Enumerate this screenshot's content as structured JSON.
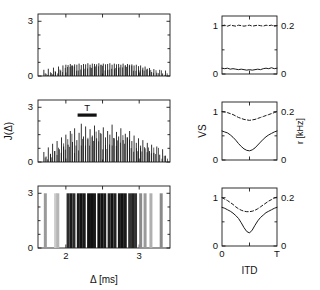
{
  "figure": {
    "title": "",
    "panels_left_ylabel": "J(Δ)",
    "panels_left_xlabel": "Δ [ms]",
    "panels_right_ylabel": "VS",
    "panels_right_ylabel2": "r [kHz]",
    "panels_right_xlabel": "ITD",
    "marker_label": "T"
  },
  "chart_data": [
    {
      "type": "bar",
      "name": "interval-histogram-top",
      "panel": "A",
      "title": "",
      "xlabel": "Δ [ms]",
      "ylabel": "J(Δ)",
      "xlim": [
        1.62,
        3.42
      ],
      "ylim": [
        0,
        3.4
      ],
      "xticks": [
        2,
        3
      ],
      "xticklabels": [
        "2",
        "3"
      ],
      "yticks": [
        0,
        3
      ],
      "yticklabels": [
        "0",
        "3"
      ],
      "grid": false,
      "description": "Flat, unmodulated interval distribution: dense short spikes of near-uniform low amplitude across the central range.",
      "x": [
        1.7,
        1.73,
        1.76,
        1.8,
        1.83,
        1.86,
        1.9,
        1.93,
        1.96,
        2.0,
        2.03,
        2.06,
        2.09,
        2.12,
        2.15,
        2.18,
        2.21,
        2.24,
        2.27,
        2.3,
        2.33,
        2.36,
        2.39,
        2.42,
        2.45,
        2.48,
        2.51,
        2.54,
        2.57,
        2.6,
        2.63,
        2.66,
        2.69,
        2.72,
        2.75,
        2.78,
        2.81,
        2.84,
        2.87,
        2.9,
        2.93,
        2.96,
        2.99,
        3.02,
        3.05,
        3.08,
        3.11,
        3.14,
        3.17,
        3.2,
        3.24,
        3.28,
        3.32,
        3.36
      ],
      "values": [
        0.34,
        0.12,
        0.4,
        0.16,
        0.46,
        0.22,
        0.52,
        0.3,
        0.58,
        0.62,
        0.6,
        0.66,
        0.58,
        0.64,
        0.62,
        0.68,
        0.6,
        0.66,
        0.64,
        0.7,
        0.62,
        0.68,
        0.66,
        0.64,
        0.7,
        0.62,
        0.68,
        0.64,
        0.66,
        0.7,
        0.62,
        0.68,
        0.64,
        0.66,
        0.62,
        0.68,
        0.6,
        0.66,
        0.62,
        0.64,
        0.58,
        0.62,
        0.54,
        0.58,
        0.46,
        0.52,
        0.4,
        0.44,
        0.22,
        0.38,
        0.18,
        0.34,
        0.14,
        0.3
      ]
    },
    {
      "type": "bar",
      "name": "interval-histogram-middle",
      "panel": "B",
      "title": "",
      "xlabel": "Δ [ms]",
      "ylabel": "J(Δ)",
      "xlim": [
        1.62,
        3.42
      ],
      "ylim": [
        0,
        3.4
      ],
      "xticks": [
        2,
        3
      ],
      "xticklabels": [
        "2",
        "3"
      ],
      "yticks": [
        0,
        3
      ],
      "yticklabels": [
        "0",
        "3"
      ],
      "grid": false,
      "marker_label": "T",
      "marker_bar_range": [
        2.16,
        2.42
      ],
      "description": "Partially modulated interval distribution: noisy spikes with irregular amplitudes up to about 2, clustered periodically.",
      "x": [
        1.7,
        1.73,
        1.76,
        1.79,
        1.82,
        1.85,
        1.88,
        1.91,
        1.94,
        1.97,
        2.0,
        2.03,
        2.06,
        2.09,
        2.12,
        2.15,
        2.18,
        2.21,
        2.24,
        2.27,
        2.3,
        2.33,
        2.36,
        2.39,
        2.42,
        2.45,
        2.48,
        2.51,
        2.54,
        2.57,
        2.6,
        2.63,
        2.66,
        2.69,
        2.72,
        2.75,
        2.78,
        2.81,
        2.84,
        2.87,
        2.9,
        2.93,
        2.96,
        2.99,
        3.02,
        3.05,
        3.08,
        3.11,
        3.14,
        3.17,
        3.2,
        3.24,
        3.28,
        3.32,
        3.36
      ],
      "values": [
        0.55,
        0.3,
        0.8,
        0.45,
        1.0,
        0.6,
        1.15,
        0.7,
        1.35,
        0.85,
        1.5,
        0.95,
        1.7,
        1.1,
        1.85,
        1.2,
        1.6,
        2.1,
        1.4,
        1.95,
        1.25,
        1.8,
        1.45,
        2.0,
        1.3,
        1.75,
        1.55,
        1.9,
        1.35,
        1.7,
        1.5,
        2.05,
        1.3,
        1.65,
        1.4,
        1.85,
        1.2,
        1.55,
        1.35,
        1.7,
        1.15,
        1.45,
        1.05,
        1.3,
        0.9,
        1.2,
        0.75,
        1.05,
        0.6,
        0.95,
        0.5,
        0.85,
        0.4,
        0.7,
        0.35
      ]
    },
    {
      "type": "bar",
      "name": "interval-histogram-bottom",
      "panel": "C",
      "title": "",
      "xlabel": "Δ [ms]",
      "ylabel": "J(Δ)",
      "xlim": [
        1.62,
        3.42
      ],
      "ylim": [
        0,
        3.4
      ],
      "xticks": [
        2,
        3
      ],
      "xticklabels": [
        "2",
        "3"
      ],
      "yticks": [
        0,
        3
      ],
      "yticklabels": [
        "0",
        "3"
      ],
      "grid": false,
      "description": "Strongly periodic interval distribution: regularly spaced saturating bars reaching the top of the axis (3), spacing about 0.14 ms.",
      "x": [
        1.72,
        1.86,
        1.89,
        2.03,
        2.07,
        2.11,
        2.17,
        2.21,
        2.25,
        2.31,
        2.35,
        2.39,
        2.45,
        2.49,
        2.53,
        2.59,
        2.63,
        2.67,
        2.73,
        2.77,
        2.81,
        2.87,
        2.91,
        2.95,
        3.02,
        3.08,
        3.16,
        3.3
      ],
      "values": [
        3.0,
        3.0,
        3.0,
        3.0,
        3.0,
        3.0,
        3.0,
        3.0,
        3.0,
        3.0,
        3.0,
        3.0,
        3.0,
        3.0,
        3.0,
        3.0,
        3.0,
        3.0,
        3.0,
        3.0,
        3.0,
        3.0,
        3.0,
        3.0,
        3.0,
        3.0,
        3.0,
        3.0
      ],
      "bar_shades": [
        "#9a9a9a",
        "#cccccc",
        "#b5b5b5",
        "#2b2b2b",
        "#1a1a1a",
        "#2b2b2b",
        "#1a1a1a",
        "#111111",
        "#1a1a1a",
        "#111111",
        "#111111",
        "#1a1a1a",
        "#111111",
        "#111111",
        "#1a1a1a",
        "#222222",
        "#111111",
        "#222222",
        "#1a1a1a",
        "#111111",
        "#1a1a1a",
        "#333333",
        "#222222",
        "#333333",
        "#8a8a8a",
        "#9a9a9a",
        "#b0b0b0",
        "#8a8a8a"
      ]
    },
    {
      "type": "line",
      "name": "itd-tuning-top",
      "panel": "D",
      "title": "",
      "xlabel": "ITD",
      "ylabel": "VS",
      "ylabel2": "r [kHz]",
      "xlim": [
        0,
        1
      ],
      "ylim": [
        0,
        1.2
      ],
      "ylim2": [
        0,
        0.24
      ],
      "xticks": [
        0,
        0.5,
        1
      ],
      "xticklabels": [
        "0",
        "",
        "T"
      ],
      "yticks": [
        0,
        1
      ],
      "yticklabels": [
        "0",
        "1"
      ],
      "y2ticks": [
        0,
        0.2
      ],
      "y2ticklabels": [
        "0",
        "0.2"
      ],
      "grid": false,
      "description": "No ITD tuning: both rate (dashed) and vector strength (solid) are essentially flat.",
      "x": [
        0.0,
        0.05,
        0.1,
        0.15,
        0.2,
        0.25,
        0.3,
        0.35,
        0.4,
        0.45,
        0.5,
        0.55,
        0.6,
        0.65,
        0.7,
        0.75,
        0.8,
        0.85,
        0.9,
        0.95,
        1.0
      ],
      "series": [
        {
          "name": "r (rate)",
          "style": "dashed",
          "axis": "right",
          "values": [
            1.0,
            1.01,
            0.99,
            1.01,
            1.0,
            0.99,
            1.01,
            1.0,
            0.99,
            1.0,
            1.01,
            0.99,
            1.0,
            1.01,
            1.0,
            0.99,
            1.01,
            1.0,
            1.01,
            0.99,
            1.0
          ]
        },
        {
          "name": "VS",
          "style": "solid",
          "axis": "left",
          "values": [
            0.12,
            0.11,
            0.12,
            0.1,
            0.11,
            0.1,
            0.09,
            0.1,
            0.09,
            0.08,
            0.09,
            0.08,
            0.09,
            0.1,
            0.09,
            0.11,
            0.12,
            0.11,
            0.13,
            0.11,
            0.12
          ]
        }
      ]
    },
    {
      "type": "line",
      "name": "itd-tuning-middle",
      "panel": "E",
      "title": "",
      "xlabel": "ITD",
      "ylabel": "VS",
      "ylabel2": "r [kHz]",
      "xlim": [
        0,
        1
      ],
      "ylim": [
        0,
        1.2
      ],
      "ylim2": [
        0,
        0.24
      ],
      "xticks": [
        0,
        0.5,
        1
      ],
      "xticklabels": [
        "0",
        "",
        "T"
      ],
      "yticks": [
        0,
        1
      ],
      "yticklabels": [
        "0",
        "1"
      ],
      "y2ticks": [
        0,
        0.2
      ],
      "y2ticklabels": [
        "0",
        "0.2"
      ],
      "grid": false,
      "description": "Moderate ITD tuning: shallow trough in rate (dashed) and a clear dip in vector strength (solid) near mid ITD.",
      "x": [
        0.0,
        0.05,
        0.1,
        0.15,
        0.2,
        0.25,
        0.3,
        0.35,
        0.4,
        0.45,
        0.5,
        0.55,
        0.6,
        0.65,
        0.7,
        0.75,
        0.8,
        0.85,
        0.9,
        0.95,
        1.0
      ],
      "series": [
        {
          "name": "r (rate)",
          "style": "dashed",
          "axis": "right",
          "values": [
            1.0,
            0.99,
            0.98,
            0.96,
            0.94,
            0.91,
            0.88,
            0.86,
            0.84,
            0.83,
            0.82,
            0.83,
            0.84,
            0.86,
            0.88,
            0.9,
            0.92,
            0.94,
            0.96,
            0.98,
            1.0
          ]
        },
        {
          "name": "VS",
          "style": "solid",
          "axis": "left",
          "values": [
            0.6,
            0.58,
            0.56,
            0.52,
            0.47,
            0.41,
            0.34,
            0.28,
            0.23,
            0.2,
            0.19,
            0.21,
            0.25,
            0.31,
            0.37,
            0.43,
            0.48,
            0.52,
            0.55,
            0.58,
            0.6
          ]
        }
      ]
    },
    {
      "type": "line",
      "name": "itd-tuning-bottom",
      "panel": "F",
      "title": "",
      "xlabel": "ITD",
      "ylabel": "VS",
      "ylabel2": "r [kHz]",
      "xlim": [
        0,
        1
      ],
      "ylim": [
        0,
        1.2
      ],
      "ylim2": [
        0,
        0.24
      ],
      "xticks": [
        0,
        0.5,
        1
      ],
      "xticklabels": [
        "0",
        "",
        "T"
      ],
      "yticks": [
        0,
        1
      ],
      "yticklabels": [
        "0",
        "1"
      ],
      "y2ticks": [
        0,
        0.2
      ],
      "y2ticklabels": [
        "0",
        "0.2"
      ],
      "grid": false,
      "description": "Strong ITD tuning: deep V-shaped trough in vector strength (solid) and pronounced dip in rate (dashed) at mid ITD.",
      "x": [
        0.0,
        0.05,
        0.1,
        0.15,
        0.2,
        0.25,
        0.3,
        0.35,
        0.4,
        0.45,
        0.5,
        0.55,
        0.6,
        0.65,
        0.7,
        0.75,
        0.8,
        0.85,
        0.9,
        0.95,
        1.0
      ],
      "series": [
        {
          "name": "r (rate)",
          "style": "dashed",
          "axis": "right",
          "values": [
            1.0,
            0.97,
            0.94,
            0.9,
            0.86,
            0.81,
            0.77,
            0.74,
            0.72,
            0.71,
            0.71,
            0.72,
            0.74,
            0.77,
            0.81,
            0.85,
            0.89,
            0.93,
            0.96,
            0.99,
            1.01
          ]
        },
        {
          "name": "VS",
          "style": "solid",
          "axis": "left",
          "values": [
            0.8,
            0.78,
            0.75,
            0.72,
            0.68,
            0.63,
            0.57,
            0.48,
            0.38,
            0.3,
            0.27,
            0.33,
            0.43,
            0.52,
            0.59,
            0.64,
            0.69,
            0.72,
            0.75,
            0.78,
            0.8
          ]
        }
      ]
    }
  ]
}
